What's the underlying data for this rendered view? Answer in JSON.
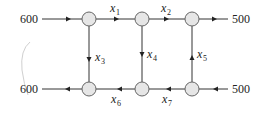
{
  "diagram": {
    "type": "traffic-flow-network",
    "nodes": [
      {
        "id": "A",
        "x": 89,
        "y": 19
      },
      {
        "id": "B",
        "x": 142,
        "y": 19
      },
      {
        "id": "C",
        "x": 192,
        "y": 19
      },
      {
        "id": "D",
        "x": 89,
        "y": 89
      },
      {
        "id": "E",
        "x": 142,
        "y": 89
      },
      {
        "id": "F",
        "x": 192,
        "y": 89
      }
    ],
    "external_flows": [
      {
        "label": "600",
        "direction": "in",
        "node": "A",
        "side": "left"
      },
      {
        "label": "500",
        "direction": "out",
        "node": "C",
        "side": "right"
      },
      {
        "label": "600",
        "direction": "out",
        "node": "D",
        "side": "left"
      },
      {
        "label": "500",
        "direction": "in",
        "node": "F",
        "side": "right"
      }
    ],
    "edges": [
      {
        "var": "x",
        "sub": "1",
        "from": "A",
        "to": "B"
      },
      {
        "var": "x",
        "sub": "2",
        "from": "B",
        "to": "C"
      },
      {
        "var": "x",
        "sub": "3",
        "from": "A",
        "to": "D"
      },
      {
        "var": "x",
        "sub": "4",
        "from": "B",
        "to": "E"
      },
      {
        "var": "x",
        "sub": "5",
        "from": "F",
        "to": "C"
      },
      {
        "var": "x",
        "sub": "6",
        "from": "E",
        "to": "D"
      },
      {
        "var": "x",
        "sub": "7",
        "from": "F",
        "to": "E"
      }
    ],
    "labels": {
      "in_top_left": "600",
      "out_top_right": "500",
      "out_bottom_left": "600",
      "in_bottom_right": "500",
      "x_var": "x",
      "s1": "1",
      "s2": "2",
      "s3": "3",
      "s4": "4",
      "s5": "5",
      "s6": "6",
      "s7": "7"
    }
  }
}
